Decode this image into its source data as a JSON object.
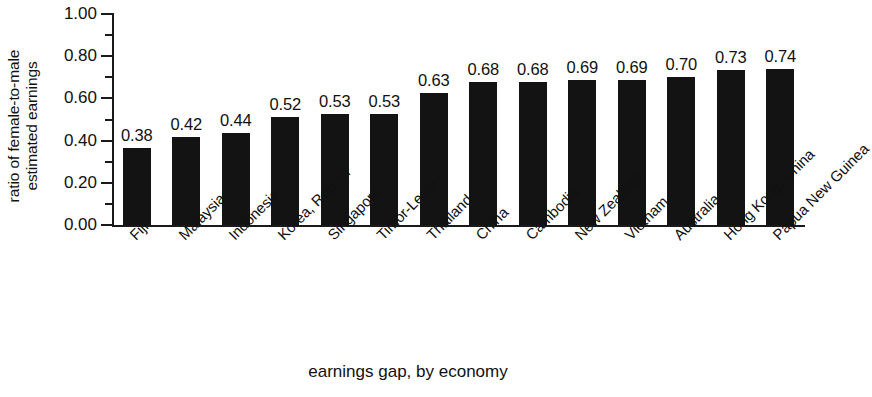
{
  "chart_data": {
    "type": "bar",
    "title": "",
    "xlabel": "earnings gap, by economy",
    "ylabel": "ratio of female-to-male estimated earnings",
    "ylabel_lines": [
      "ratio of female-to-male",
      "estimated earnings"
    ],
    "categories": [
      "Fiji",
      "Malaysia",
      "Indonesia",
      "Korea, Rep. of",
      "Singapore",
      "Timor-Leste",
      "Thailand",
      "China",
      "Cambodia",
      "New Zealand",
      "Vietnam",
      "Australia",
      "Hong Kong, China",
      "Papua New Guinea"
    ],
    "values": [
      0.38,
      0.42,
      0.44,
      0.52,
      0.53,
      0.53,
      0.63,
      0.68,
      0.68,
      0.69,
      0.69,
      0.7,
      0.73,
      0.74
    ],
    "data_labels": [
      "0.38",
      "0.42",
      "0.44",
      "0.52",
      "0.53",
      "0.53",
      "0.63",
      "0.68",
      "0.68",
      "0.69",
      "0.69",
      "0.70",
      "0.73",
      "0.74"
    ],
    "bar_fractions": [
      0.365,
      0.415,
      0.435,
      0.512,
      0.527,
      0.527,
      0.625,
      0.678,
      0.678,
      0.688,
      0.688,
      0.7,
      0.733,
      0.74
    ],
    "ylim": [
      0.0,
      1.0
    ],
    "ytick_labels": [
      "0.00",
      "0.20",
      "0.40",
      "0.60",
      "0.80",
      "1.00"
    ],
    "ytick_values": [
      0.0,
      0.2,
      0.4,
      0.6,
      0.8,
      1.0
    ],
    "yminor_values": [
      0.1,
      0.3,
      0.5,
      0.7,
      0.9
    ],
    "grid": false,
    "legend": "none",
    "bar_color": "#131313",
    "axis_color": "#1a1a1a",
    "background_color": "#ffffff"
  }
}
